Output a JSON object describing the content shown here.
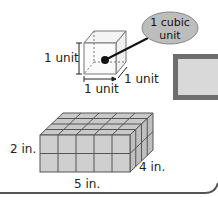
{
  "unit_cube": {
    "callout": {
      "line1": "1 cubic",
      "line2": "unit"
    },
    "height_label": "1 unit",
    "width_label": "1 unit",
    "depth_label": "1 unit"
  },
  "prism": {
    "height_label": "2 in.",
    "depth_label": "4 in.",
    "length_label": "5 in.",
    "length": 5,
    "depth": 4,
    "height": 2
  },
  "colors": {
    "cube_fill": "#dcdcdc",
    "cube_top": "#c8c8c8",
    "ellipse": "#bdbdbd",
    "panel_border": "#6e6e6e",
    "panel_fill": "#d9d9d9"
  }
}
